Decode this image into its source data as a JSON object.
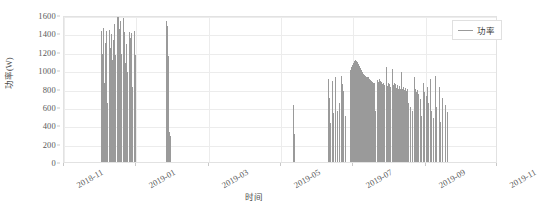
{
  "chart_data": {
    "type": "line",
    "title": "",
    "xlabel": "时间",
    "ylabel": "功率(W)",
    "ylim": [
      0,
      1600
    ],
    "ytick_values": [
      0,
      200,
      400,
      600,
      800,
      1000,
      1200,
      1400,
      1600
    ],
    "ytick_labels": [
      "0",
      "200",
      "400",
      "600",
      "800",
      "1000",
      "1200",
      "1400",
      "1600"
    ],
    "xlim": [
      "2018-11",
      "2019-11"
    ],
    "xtick_labels": [
      "2018-11",
      "2019-01",
      "2019-03",
      "2019-05",
      "2019-07",
      "2019-09",
      "2019-11"
    ],
    "xtick_fractions": [
      0.0,
      0.1667,
      0.3333,
      0.5,
      0.6667,
      0.8333,
      1.0
    ],
    "grid": true,
    "legend_position": "upper right",
    "series": [
      {
        "name": "功率",
        "color": "#9a9a9a",
        "points": [
          {
            "x": 0.0855,
            "y": 1430
          },
          {
            "x": 0.0875,
            "y": 1180
          },
          {
            "x": 0.0895,
            "y": 1455
          },
          {
            "x": 0.0915,
            "y": 860
          },
          {
            "x": 0.0935,
            "y": 1300
          },
          {
            "x": 0.0955,
            "y": 1100
          },
          {
            "x": 0.0975,
            "y": 1425
          },
          {
            "x": 0.0995,
            "y": 640
          },
          {
            "x": 0.1035,
            "y": 1440
          },
          {
            "x": 0.1055,
            "y": 1240
          },
          {
            "x": 0.1075,
            "y": 1395
          },
          {
            "x": 0.1095,
            "y": 1115
          },
          {
            "x": 0.1135,
            "y": 1330
          },
          {
            "x": 0.1155,
            "y": 1505
          },
          {
            "x": 0.1175,
            "y": 1165
          },
          {
            "x": 0.1215,
            "y": 1575
          },
          {
            "x": 0.1235,
            "y": 1360
          },
          {
            "x": 0.1255,
            "y": 1600
          },
          {
            "x": 0.1275,
            "y": 1445
          },
          {
            "x": 0.1295,
            "y": 1540
          },
          {
            "x": 0.1315,
            "y": 1180
          },
          {
            "x": 0.1355,
            "y": 1565
          },
          {
            "x": 0.1375,
            "y": 1410
          },
          {
            "x": 0.1395,
            "y": 1080
          },
          {
            "x": 0.1435,
            "y": 1285
          },
          {
            "x": 0.1455,
            "y": 985
          },
          {
            "x": 0.1495,
            "y": 1420
          },
          {
            "x": 0.1515,
            "y": 1350
          },
          {
            "x": 0.1555,
            "y": 1400
          },
          {
            "x": 0.1575,
            "y": 820
          },
          {
            "x": 0.1615,
            "y": 1425
          },
          {
            "x": 0.1635,
            "y": 1160
          },
          {
            "x": 0.2355,
            "y": 1530
          },
          {
            "x": 0.2375,
            "y": 1480
          },
          {
            "x": 0.2395,
            "y": 1150
          },
          {
            "x": 0.2415,
            "y": 330
          },
          {
            "x": 0.2435,
            "y": 280
          },
          {
            "x": 0.5275,
            "y": 625
          },
          {
            "x": 0.5295,
            "y": 300
          },
          {
            "x": 0.6075,
            "y": 900
          },
          {
            "x": 0.6095,
            "y": 640
          },
          {
            "x": 0.6115,
            "y": 700
          },
          {
            "x": 0.6135,
            "y": 420
          },
          {
            "x": 0.6175,
            "y": 880
          },
          {
            "x": 0.6195,
            "y": 530
          },
          {
            "x": 0.6235,
            "y": 925
          },
          {
            "x": 0.6255,
            "y": 480
          },
          {
            "x": 0.6295,
            "y": 560
          },
          {
            "x": 0.6335,
            "y": 640
          },
          {
            "x": 0.6375,
            "y": 935
          },
          {
            "x": 0.6395,
            "y": 845
          },
          {
            "x": 0.6435,
            "y": 770
          },
          {
            "x": 0.6475,
            "y": 500
          },
          {
            "x": 0.6595,
            "y": 1000
          },
          {
            "x": 0.6615,
            "y": 1035
          },
          {
            "x": 0.6635,
            "y": 1060
          },
          {
            "x": 0.6655,
            "y": 1075
          },
          {
            "x": 0.6675,
            "y": 1095
          },
          {
            "x": 0.6695,
            "y": 1105
          },
          {
            "x": 0.6715,
            "y": 1110
          },
          {
            "x": 0.6735,
            "y": 1100
          },
          {
            "x": 0.6755,
            "y": 1085
          },
          {
            "x": 0.6775,
            "y": 1065
          },
          {
            "x": 0.6795,
            "y": 1040
          },
          {
            "x": 0.6815,
            "y": 1020
          },
          {
            "x": 0.6835,
            "y": 1000
          },
          {
            "x": 0.6855,
            "y": 985
          },
          {
            "x": 0.6875,
            "y": 970
          },
          {
            "x": 0.6895,
            "y": 960
          },
          {
            "x": 0.6915,
            "y": 950
          },
          {
            "x": 0.6935,
            "y": 940
          },
          {
            "x": 0.6955,
            "y": 930
          },
          {
            "x": 0.6975,
            "y": 925
          },
          {
            "x": 0.6995,
            "y": 920
          },
          {
            "x": 0.7015,
            "y": 910
          },
          {
            "x": 0.7035,
            "y": 900
          },
          {
            "x": 0.7055,
            "y": 890
          },
          {
            "x": 0.7075,
            "y": 880
          },
          {
            "x": 0.7095,
            "y": 870
          },
          {
            "x": 0.7115,
            "y": 865
          },
          {
            "x": 0.7135,
            "y": 860
          },
          {
            "x": 0.7175,
            "y": 560
          },
          {
            "x": 0.7215,
            "y": 895
          },
          {
            "x": 0.7235,
            "y": 870
          },
          {
            "x": 0.7255,
            "y": 905
          },
          {
            "x": 0.7275,
            "y": 880
          },
          {
            "x": 0.7295,
            "y": 860
          },
          {
            "x": 0.7315,
            "y": 870
          },
          {
            "x": 0.7335,
            "y": 845
          },
          {
            "x": 0.7355,
            "y": 855
          },
          {
            "x": 0.7375,
            "y": 840
          },
          {
            "x": 0.7415,
            "y": 1030
          },
          {
            "x": 0.7435,
            "y": 830
          },
          {
            "x": 0.7455,
            "y": 860
          },
          {
            "x": 0.7475,
            "y": 835
          },
          {
            "x": 0.7495,
            "y": 845
          },
          {
            "x": 0.7515,
            "y": 820
          },
          {
            "x": 0.7555,
            "y": 1015
          },
          {
            "x": 0.7575,
            "y": 840
          },
          {
            "x": 0.7595,
            "y": 860
          },
          {
            "x": 0.7615,
            "y": 830
          },
          {
            "x": 0.7635,
            "y": 850
          },
          {
            "x": 0.7655,
            "y": 810
          },
          {
            "x": 0.7675,
            "y": 835
          },
          {
            "x": 0.7695,
            "y": 800
          },
          {
            "x": 0.7715,
            "y": 825
          },
          {
            "x": 0.7735,
            "y": 790
          },
          {
            "x": 0.7775,
            "y": 985
          },
          {
            "x": 0.7795,
            "y": 800
          },
          {
            "x": 0.7815,
            "y": 820
          },
          {
            "x": 0.7835,
            "y": 780
          },
          {
            "x": 0.7855,
            "y": 805
          },
          {
            "x": 0.7875,
            "y": 770
          },
          {
            "x": 0.7895,
            "y": 795
          },
          {
            "x": 0.7935,
            "y": 640
          },
          {
            "x": 0.7975,
            "y": 600
          },
          {
            "x": 0.8015,
            "y": 560
          },
          {
            "x": 0.8055,
            "y": 930
          },
          {
            "x": 0.8075,
            "y": 780
          },
          {
            "x": 0.8095,
            "y": 800
          },
          {
            "x": 0.8115,
            "y": 760
          },
          {
            "x": 0.8135,
            "y": 785
          },
          {
            "x": 0.8155,
            "y": 740
          },
          {
            "x": 0.8195,
            "y": 690
          },
          {
            "x": 0.8235,
            "y": 500
          },
          {
            "x": 0.8275,
            "y": 860
          },
          {
            "x": 0.8295,
            "y": 760
          },
          {
            "x": 0.8335,
            "y": 720
          },
          {
            "x": 0.8375,
            "y": 820
          },
          {
            "x": 0.8395,
            "y": 640
          },
          {
            "x": 0.8435,
            "y": 900
          },
          {
            "x": 0.8455,
            "y": 560
          },
          {
            "x": 0.8495,
            "y": 480
          },
          {
            "x": 0.8555,
            "y": 940
          },
          {
            "x": 0.8575,
            "y": 600
          },
          {
            "x": 0.8635,
            "y": 820
          },
          {
            "x": 0.8655,
            "y": 440
          },
          {
            "x": 0.8715,
            "y": 700
          },
          {
            "x": 0.8775,
            "y": 620
          },
          {
            "x": 0.8835,
            "y": 540
          }
        ]
      }
    ]
  },
  "legend": {
    "entries": [
      {
        "label": "功率",
        "color": "#9a9a9a"
      }
    ]
  },
  "axes": {
    "y_title": "功率(W)",
    "x_title": "时间"
  },
  "caption": ""
}
